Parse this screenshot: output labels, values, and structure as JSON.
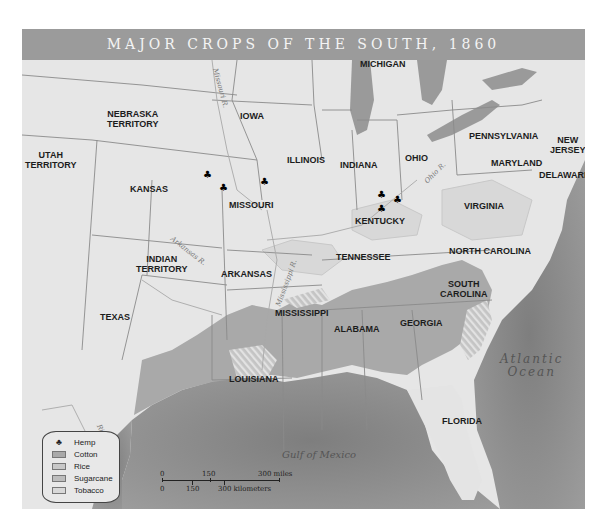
{
  "title": "MAJOR CROPS OF THE SOUTH, 1860",
  "colors": {
    "title_bar": "#9b9b9b",
    "land": "#e6e6e6",
    "ocean": "#8c8c8c",
    "lakes": "#9a9a9a",
    "cotton": "#a9a9a9",
    "rice": "#c8c8c8",
    "sugarcane": "#bdbdbd",
    "tobacco": "#d8d8d8",
    "hemp": "#000000"
  },
  "states": {
    "nebraska": "NEBRASKA\nTERRITORY",
    "iowa": "IOWA",
    "wisconsin": "WISCONSIN",
    "michigan": "MICHIGAN",
    "new_york": "NEW YORK",
    "utah": "UTAH\nTERRITORY",
    "kansas": "KANSAS",
    "missouri": "MISSOURI",
    "illinois": "ILLINOIS",
    "indiana": "INDIANA",
    "ohio": "OHIO",
    "pennsylvania": "PENNSYLVANIA",
    "new_jersey": "NEW\nJERSEY",
    "maryland": "MARYLAND",
    "delaware": "DELAWARE",
    "kentucky": "KENTUCKY",
    "virginia": "VIRGINIA",
    "indian_territory": "INDIAN\nTERRITORY",
    "arkansas": "ARKANSAS",
    "tennessee": "TENNESSEE",
    "north_carolina": "NORTH CAROLINA",
    "south_carolina": "SOUTH\nCAROLINA",
    "mississippi": "MISSISSIPPI",
    "alabama": "ALABAMA",
    "georgia": "GEORGIA",
    "texas": "TEXAS",
    "louisiana": "LOUISIANA",
    "florida": "FLORIDA"
  },
  "rivers": {
    "missouri": "Missouri R.",
    "arkansas": "Arkansas R.",
    "mississippi": "Mississippi R.",
    "ohio": "Ohio R.",
    "rio_grande": "Rio Grande"
  },
  "water_bodies": {
    "atlantic_line1": "Atlantic",
    "atlantic_line2": "Ocean",
    "gulf": "Gulf of Mexico"
  },
  "legend": {
    "items": [
      {
        "label": "Hemp",
        "icon": "hemp-leaf-icon"
      },
      {
        "label": "Cotton",
        "color": "#a9a9a9"
      },
      {
        "label": "Rice",
        "color": "#c8c8c8"
      },
      {
        "label": "Sugarcane",
        "color": "#bdbdbd"
      },
      {
        "label": "Tobacco",
        "color": "#d8d8d8"
      }
    ]
  },
  "scale": {
    "miles": [
      "0",
      "150",
      "300 miles"
    ],
    "kilometers": [
      "0",
      "150",
      "300 kilometers"
    ]
  },
  "hemp_symbol": "♣"
}
